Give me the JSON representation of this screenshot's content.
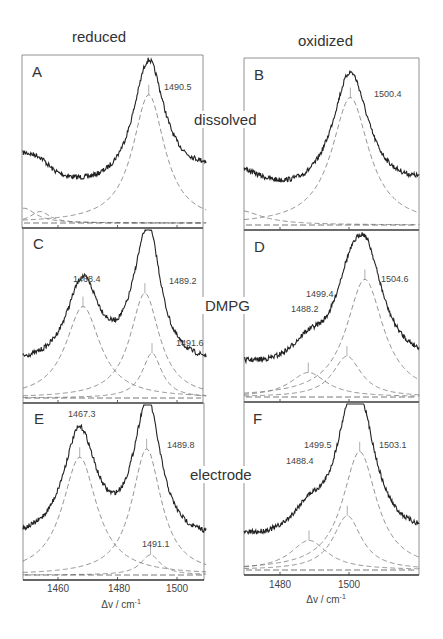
{
  "figure": {
    "column_titles": [
      "reduced",
      "oxidized"
    ],
    "row_labels": [
      "dissolved",
      "DMPG",
      "electrode"
    ],
    "xlabel": "Δv / cm",
    "xlabel_exp": "-1"
  },
  "chart_data": [
    {
      "type": "line",
      "panel": "A",
      "column": "reduced",
      "row": "dissolved",
      "x_range": [
        1448,
        1510
      ],
      "xticks": [
        1460,
        1480,
        1500
      ],
      "xlabel": "Δv/cm-1",
      "fitted_bands": [
        {
          "center": 1490.5,
          "labeled": true,
          "rel_height": 0.78,
          "hwhm": 6.5
        },
        {
          "center": 1448.5,
          "labeled": false,
          "rel_height": 0.09,
          "hwhm": 5
        },
        {
          "center": 1454.0,
          "labeled": false,
          "rel_height": 0.07,
          "hwhm": 4
        }
      ],
      "annotations": [
        "1490.5"
      ],
      "baseline_level": 0.33
    },
    {
      "type": "line",
      "panel": "B",
      "column": "oxidized",
      "row": "dissolved",
      "x_range": [
        1470,
        1521
      ],
      "xticks": [
        1480,
        1500
      ],
      "xlabel": "Δv/cm-1",
      "fitted_bands": [
        {
          "center": 1500.4,
          "labeled": true,
          "rel_height": 0.78,
          "hwhm": 6.5
        },
        {
          "center": 1468.0,
          "labeled": false,
          "rel_height": 0.09,
          "hwhm": 8
        }
      ],
      "annotations": [
        "1500.4"
      ],
      "baseline_level": 0.25
    },
    {
      "type": "line",
      "panel": "C",
      "column": "reduced",
      "row": "DMPG",
      "x_range": [
        1448,
        1510
      ],
      "xticks": [
        1460,
        1480,
        1500
      ],
      "fitted_bands": [
        {
          "center": 1468.4,
          "labeled": true,
          "rel_height": 0.55,
          "hwhm": 7
        },
        {
          "center": 1489.2,
          "labeled": true,
          "rel_height": 0.63,
          "hwhm": 6
        },
        {
          "center": 1491.6,
          "labeled": true,
          "rel_height": 0.27,
          "hwhm": 4
        }
      ],
      "annotations": [
        "1468.4",
        "1489.2",
        "1491.6"
      ]
    },
    {
      "type": "line",
      "panel": "D",
      "column": "oxidized",
      "row": "DMPG",
      "x_range": [
        1470,
        1521
      ],
      "xticks": [
        1480,
        1500
      ],
      "fitted_bands": [
        {
          "center": 1488.2,
          "labeled": true,
          "rel_height": 0.15,
          "hwhm": 6.5
        },
        {
          "center": 1499.4,
          "labeled": true,
          "rel_height": 0.25,
          "hwhm": 5
        },
        {
          "center": 1504.6,
          "labeled": true,
          "rel_height": 0.72,
          "hwhm": 6.5
        }
      ],
      "annotations": [
        "1488.2",
        "1499.4",
        "1504.6"
      ]
    },
    {
      "type": "line",
      "panel": "E",
      "column": "reduced",
      "row": "electrode",
      "x_range": [
        1448,
        1510
      ],
      "xticks": [
        1460,
        1480,
        1500
      ],
      "xlabel": "Δv/cm-1",
      "fitted_bands": [
        {
          "center": 1467.3,
          "labeled": true,
          "rel_height": 0.7,
          "hwhm": 7
        },
        {
          "center": 1489.8,
          "labeled": true,
          "rel_height": 0.75,
          "hwhm": 6
        },
        {
          "center": 1491.1,
          "labeled": true,
          "rel_height": 0.12,
          "hwhm": 4
        }
      ],
      "annotations": [
        "1467.3",
        "1489.8",
        "1491.1"
      ]
    },
    {
      "type": "line",
      "panel": "F",
      "column": "oxidized",
      "row": "electrode",
      "x_range": [
        1470,
        1521
      ],
      "xticks": [
        1480,
        1500
      ],
      "xlabel": "Δv/cm-1",
      "fitted_bands": [
        {
          "center": 1488.4,
          "labeled": true,
          "rel_height": 0.18,
          "hwhm": 6.5
        },
        {
          "center": 1499.5,
          "labeled": true,
          "rel_height": 0.33,
          "hwhm": 5
        },
        {
          "center": 1503.1,
          "labeled": true,
          "rel_height": 0.72,
          "hwhm": 6
        }
      ],
      "annotations": [
        "1488.4",
        "1499.5",
        "1503.1"
      ]
    }
  ]
}
